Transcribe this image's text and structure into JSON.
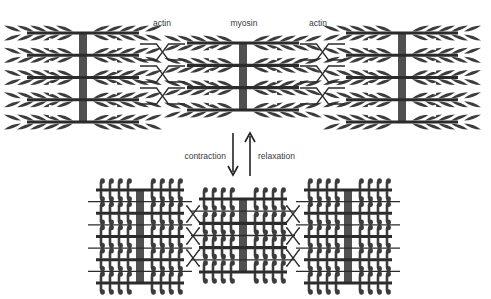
{
  "diagram": {
    "colors": {
      "filament": "#2b2b2b",
      "z_line": "#505050",
      "heads": "#3c3c3c",
      "text": "#3a3a3a",
      "background": "#ffffff"
    },
    "labels": {
      "actin_left": "actin",
      "myosin": "myosin",
      "actin_right": "actin",
      "contraction": "contraction",
      "relaxation": "relaxation"
    },
    "states": [
      {
        "name": "relaxed",
        "blocks": [
          {
            "role": "actin-left",
            "filaments": 5,
            "head_style": "leaf"
          },
          {
            "role": "myosin",
            "filaments": 4,
            "head_style": "leaf"
          },
          {
            "role": "actin-right",
            "filaments": 5,
            "head_style": "leaf"
          }
        ],
        "connectors": 4
      },
      {
        "name": "contracted",
        "blocks": [
          {
            "role": "actin-left",
            "filaments": 5,
            "head_style": "hook"
          },
          {
            "role": "myosin",
            "filaments": 4,
            "head_style": "hook"
          },
          {
            "role": "actin-right",
            "filaments": 5,
            "head_style": "hook"
          }
        ],
        "connectors": 4
      }
    ],
    "transitions": [
      {
        "label_key": "contraction",
        "direction": "down"
      },
      {
        "label_key": "relaxation",
        "direction": "up"
      }
    ]
  }
}
